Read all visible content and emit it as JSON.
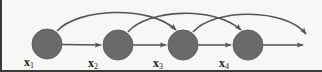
{
  "figure": {
    "type": "directed-graph",
    "background_color": "#f7f7f5",
    "border_color": "#3a3a3a",
    "node_fill_color": "#6a6a6a",
    "node_stroke_color": "#5a5a5a",
    "arrow_color": "#555555",
    "label_color": "#1a1a1a"
  },
  "nodes": [
    {
      "id": "x1",
      "label": "x",
      "subscript": "1",
      "cx": 47,
      "cy": 44,
      "r": 15,
      "label_x": 24,
      "label_y": 57
    },
    {
      "id": "x2",
      "label": "x",
      "subscript": "2",
      "cx": 118,
      "cy": 45,
      "r": 15,
      "label_x": 88,
      "label_y": 58
    },
    {
      "id": "x3",
      "label": "x",
      "subscript": "3",
      "cx": 183,
      "cy": 45,
      "r": 15,
      "label_x": 153,
      "label_y": 58
    },
    {
      "id": "x4",
      "label": "x",
      "subscript": "4",
      "cx": 248,
      "cy": 45,
      "r": 15,
      "label_x": 219,
      "label_y": 58
    }
  ],
  "straight_edges": [
    {
      "from": "x1",
      "to": "x2"
    },
    {
      "from": "x2",
      "to": "x3"
    },
    {
      "from": "x3",
      "to": "x4"
    },
    {
      "from": "x4",
      "to": "outside"
    }
  ],
  "curved_edges": [
    {
      "from": "x1",
      "to": "x3"
    },
    {
      "from": "x2",
      "to": "x4"
    },
    {
      "from": "x3",
      "to": "outside"
    }
  ]
}
